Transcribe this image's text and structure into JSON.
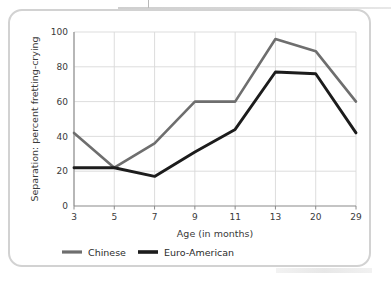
{
  "chart_data": {
    "type": "line",
    "title": "",
    "xlabel": "Age (in months)",
    "ylabel": "Separation: percent fretting-crying",
    "categories": [
      "3",
      "5",
      "7",
      "9",
      "11",
      "13",
      "20",
      "29"
    ],
    "ylim": [
      0,
      100
    ],
    "yticks": [
      "0",
      "20",
      "40",
      "60",
      "80",
      "100"
    ],
    "grid": true,
    "legend_position": "bottom",
    "series": [
      {
        "name": "Chinese",
        "color": "#6e6e6e",
        "values": [
          42,
          22,
          36,
          60,
          60,
          96,
          89,
          60
        ]
      },
      {
        "name": "Euro-American",
        "color": "#1c1c1c",
        "values": [
          22,
          22,
          17,
          31,
          44,
          77,
          76,
          42
        ]
      }
    ]
  },
  "axis": {
    "y_label": "Separation: percent fretting-crying",
    "x_label": "Age (in months)",
    "y_ticks": [
      "100",
      "80",
      "60",
      "40",
      "20",
      "0"
    ],
    "x_ticks": [
      "3",
      "5",
      "7",
      "9",
      "11",
      "13",
      "20",
      "29"
    ]
  },
  "legend": {
    "items": [
      {
        "label": "Chinese",
        "color": "#6e6e6e"
      },
      {
        "label": "Euro-American",
        "color": "#1c1c1c"
      }
    ]
  },
  "colors": {
    "chinese_line": "#6e6e6e",
    "euro_american_line": "#1c1c1c",
    "gridline": "#d9d9d9",
    "axis": "#8a8a8a",
    "card_border": "#d2d2d2"
  }
}
